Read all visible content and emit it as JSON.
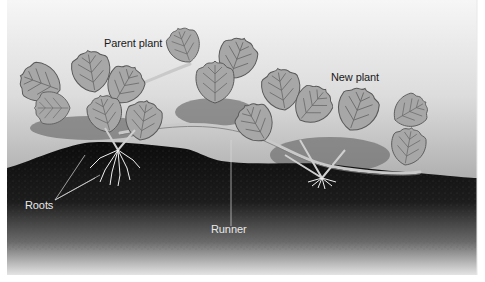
{
  "diagram": {
    "labels": {
      "parent_plant": "Parent plant",
      "new_plant": "New plant",
      "roots": "Roots",
      "runner": "Runner"
    },
    "colors": {
      "sky_top": "#f4f4f4",
      "sky_bottom": "#9a9a9a",
      "leaf_fill": "#a6a6a6",
      "leaf_edge": "#5a5a5a",
      "soil_top": "#111111",
      "soil_bottom": "#e0e0e0",
      "shadow": "#6f6f6f",
      "root": "#f2f2f2"
    }
  }
}
